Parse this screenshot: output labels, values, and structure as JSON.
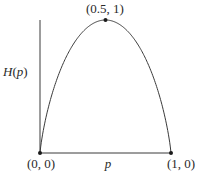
{
  "chart_data": {
    "type": "line",
    "title": "",
    "xlabel": "p",
    "ylabel": "H(p)",
    "xlim": [
      0,
      1
    ],
    "ylim": [
      0,
      1
    ],
    "grid": false,
    "legend": null,
    "series": [
      {
        "name": "H(p)",
        "function": "-p*log2(p) - (1-p)*log2(1-p)",
        "x": [
          0,
          0.05,
          0.1,
          0.15,
          0.2,
          0.25,
          0.3,
          0.35,
          0.4,
          0.45,
          0.5,
          0.55,
          0.6,
          0.65,
          0.7,
          0.75,
          0.8,
          0.85,
          0.9,
          0.95,
          1
        ],
        "y": [
          0,
          0.286,
          0.469,
          0.61,
          0.722,
          0.811,
          0.881,
          0.934,
          0.971,
          0.993,
          1,
          0.993,
          0.971,
          0.934,
          0.881,
          0.811,
          0.722,
          0.61,
          0.469,
          0.286,
          0
        ]
      }
    ],
    "annotations": [
      {
        "label": "(0, 0)",
        "x": 0,
        "y": 0
      },
      {
        "label": "(0.5, 1)",
        "x": 0.5,
        "y": 1
      },
      {
        "label": "(1, 0)",
        "x": 1,
        "y": 0
      }
    ]
  },
  "labels": {
    "ylabel": "H(p)",
    "ylabel_H": "H",
    "ylabel_open": "(",
    "ylabel_p": "p",
    "ylabel_close": ")",
    "xlabel": "p",
    "origin": "(0, 0)",
    "peak": "(0.5, 1)",
    "right_end": "(1, 0)"
  },
  "colors": {
    "line": "#3a3a3a",
    "point": "#1a1a1a",
    "text": "#2a2a2a"
  }
}
